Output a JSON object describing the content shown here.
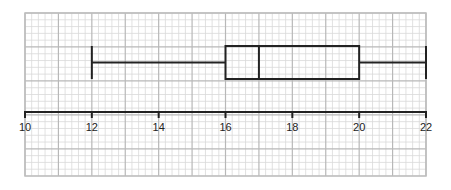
{
  "chart_data": {
    "type": "boxplot",
    "title": "",
    "xlabel": "",
    "ylabel": "",
    "orientation": "horizontal",
    "xlim": [
      10,
      22
    ],
    "x_ticks": [
      10,
      12,
      14,
      16,
      18,
      20,
      22
    ],
    "x_tick_labels": [
      "10",
      "12",
      "14",
      "16",
      "18",
      "20",
      "22"
    ],
    "grid": {
      "on": true,
      "style": "graph-paper",
      "major_step": 1,
      "minor_divisions": 5
    },
    "series": [
      {
        "name": "",
        "min": 12,
        "q1": 16,
        "median": 17,
        "q3": 20,
        "max": 22
      }
    ],
    "legend": null
  },
  "colors": {
    "background": "#ffffff",
    "grid_minor": "#d9d9d9",
    "grid_major": "#b8b8b8",
    "border": "#bdbdbd",
    "plot_line": "#222222",
    "label_text": "#222222"
  }
}
